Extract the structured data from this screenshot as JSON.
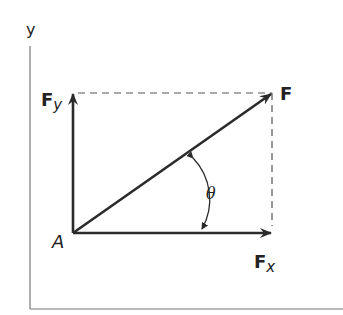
{
  "diagram": {
    "axes": {
      "y_label": "y"
    },
    "origin_label": "A",
    "vectors": {
      "resultant": {
        "label": "F",
        "from": [
          73,
          233
        ],
        "to": [
          272,
          93
        ]
      },
      "x_component": {
        "label": "F",
        "subscript": "x",
        "from": [
          73,
          233
        ],
        "to": [
          272,
          233
        ]
      },
      "y_component": {
        "label": "F",
        "subscript": "y",
        "from": [
          73,
          233
        ],
        "to": [
          73,
          93
        ]
      }
    },
    "angle_label": "θ",
    "colors": {
      "vector": "#2b2b2b",
      "axis": "#777777",
      "dashed": "#555555"
    }
  }
}
